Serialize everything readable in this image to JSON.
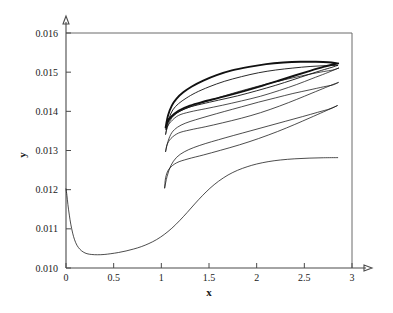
{
  "chart_data": {
    "type": "line",
    "title": "",
    "subtitle": "",
    "xlabel": "x",
    "ylabel": "y",
    "xlim": [
      0,
      3
    ],
    "ylim": [
      0.01,
      0.016
    ],
    "grid": false,
    "legend": null,
    "x_ticks": [
      "0",
      "0.5",
      "1",
      "1.5",
      "2",
      "2.5",
      "3"
    ],
    "x_tick_values": [
      0,
      0.5,
      1,
      1.5,
      2,
      2.5,
      3
    ],
    "y_ticks": [
      "0.010",
      "0.011",
      "0.012",
      "0.013",
      "0.014",
      "0.015",
      "0.016"
    ],
    "y_tick_values": [
      0.01,
      0.011,
      0.012,
      0.013,
      0.014,
      0.015,
      0.016
    ],
    "series": [
      {
        "name": "lower-branch",
        "style": "thin",
        "points": [
          [
            0.0,
            0.01202
          ],
          [
            0.01,
            0.01185
          ],
          [
            0.02,
            0.01162
          ],
          [
            0.035,
            0.01135
          ],
          [
            0.05,
            0.01112
          ],
          [
            0.07,
            0.01089
          ],
          [
            0.09,
            0.01072
          ],
          [
            0.115,
            0.01058
          ],
          [
            0.145,
            0.01048
          ],
          [
            0.18,
            0.01041
          ],
          [
            0.22,
            0.010365
          ],
          [
            0.27,
            0.010345
          ],
          [
            0.33,
            0.010338
          ],
          [
            0.4,
            0.010345
          ],
          [
            0.47,
            0.010365
          ],
          [
            0.55,
            0.010395
          ],
          [
            0.63,
            0.010435
          ],
          [
            0.71,
            0.010485
          ],
          [
            0.79,
            0.010545
          ],
          [
            0.87,
            0.010625
          ],
          [
            0.95,
            0.010725
          ],
          [
            1.03,
            0.010855
          ],
          [
            1.11,
            0.011015
          ],
          [
            1.19,
            0.011205
          ],
          [
            1.27,
            0.011415
          ],
          [
            1.35,
            0.011635
          ],
          [
            1.43,
            0.011845
          ],
          [
            1.51,
            0.012035
          ],
          [
            1.6,
            0.012215
          ],
          [
            1.7,
            0.012375
          ],
          [
            1.8,
            0.012495
          ],
          [
            1.9,
            0.012585
          ],
          [
            2.0,
            0.012655
          ],
          [
            2.12,
            0.012715
          ],
          [
            2.25,
            0.012758
          ],
          [
            2.4,
            0.012788
          ],
          [
            2.55,
            0.012805
          ],
          [
            2.7,
            0.012815
          ],
          [
            2.85,
            0.012818
          ]
        ]
      },
      {
        "name": "loop-1-outer-low",
        "style": "thin",
        "upper": [
          [
            1.035,
            0.012045
          ],
          [
            1.06,
            0.012335
          ],
          [
            1.1,
            0.012615
          ],
          [
            1.16,
            0.012825
          ],
          [
            1.24,
            0.012965
          ],
          [
            1.34,
            0.013075
          ],
          [
            1.46,
            0.013175
          ],
          [
            1.6,
            0.013275
          ],
          [
            1.76,
            0.013385
          ],
          [
            1.94,
            0.013505
          ],
          [
            2.12,
            0.013625
          ],
          [
            2.3,
            0.013745
          ],
          [
            2.48,
            0.013865
          ],
          [
            2.64,
            0.013975
          ],
          [
            2.77,
            0.014065
          ],
          [
            2.845,
            0.014145
          ]
        ],
        "lower": [
          [
            2.845,
            0.014145
          ],
          [
            2.8,
            0.014095
          ],
          [
            2.7,
            0.013985
          ],
          [
            2.56,
            0.013835
          ],
          [
            2.4,
            0.013665
          ],
          [
            2.22,
            0.013485
          ],
          [
            2.02,
            0.013305
          ],
          [
            1.82,
            0.013145
          ],
          [
            1.62,
            0.013005
          ],
          [
            1.44,
            0.012885
          ],
          [
            1.28,
            0.012785
          ],
          [
            1.16,
            0.012685
          ],
          [
            1.08,
            0.012525
          ],
          [
            1.045,
            0.012305
          ],
          [
            1.035,
            0.012045
          ]
        ]
      },
      {
        "name": "loop-2-mid",
        "style": "thin",
        "upper": [
          [
            1.045,
            0.012975
          ],
          [
            1.07,
            0.013235
          ],
          [
            1.11,
            0.013455
          ],
          [
            1.17,
            0.013595
          ],
          [
            1.25,
            0.013695
          ],
          [
            1.36,
            0.013785
          ],
          [
            1.5,
            0.013885
          ],
          [
            1.66,
            0.013995
          ],
          [
            1.84,
            0.014115
          ],
          [
            2.02,
            0.014235
          ],
          [
            2.2,
            0.014345
          ],
          [
            2.38,
            0.014455
          ],
          [
            2.55,
            0.014545
          ],
          [
            2.7,
            0.014625
          ],
          [
            2.8,
            0.014675
          ],
          [
            2.855,
            0.014735
          ]
        ],
        "lower": [
          [
            2.855,
            0.014735
          ],
          [
            2.81,
            0.014695
          ],
          [
            2.72,
            0.014605
          ],
          [
            2.58,
            0.014465
          ],
          [
            2.42,
            0.014305
          ],
          [
            2.24,
            0.014135
          ],
          [
            2.04,
            0.013965
          ],
          [
            1.84,
            0.013825
          ],
          [
            1.64,
            0.013705
          ],
          [
            1.46,
            0.013605
          ],
          [
            1.3,
            0.013525
          ],
          [
            1.18,
            0.013445
          ],
          [
            1.1,
            0.013305
          ],
          [
            1.06,
            0.013145
          ],
          [
            1.045,
            0.012975
          ]
        ]
      },
      {
        "name": "loop-3-upper",
        "style": "thin",
        "upper": [
          [
            1.045,
            0.013415
          ],
          [
            1.07,
            0.013645
          ],
          [
            1.11,
            0.013835
          ],
          [
            1.17,
            0.013965
          ],
          [
            1.25,
            0.014065
          ],
          [
            1.36,
            0.014165
          ],
          [
            1.5,
            0.014275
          ],
          [
            1.66,
            0.014395
          ],
          [
            1.84,
            0.014525
          ],
          [
            2.02,
            0.014645
          ],
          [
            2.2,
            0.014755
          ],
          [
            2.38,
            0.014855
          ],
          [
            2.55,
            0.014945
          ],
          [
            2.7,
            0.015015
          ],
          [
            2.8,
            0.015055
          ],
          [
            2.86,
            0.015105
          ]
        ],
        "lower": [
          [
            2.86,
            0.015105
          ],
          [
            2.81,
            0.015055
          ],
          [
            2.72,
            0.014965
          ],
          [
            2.58,
            0.014835
          ],
          [
            2.42,
            0.014685
          ],
          [
            2.24,
            0.014535
          ],
          [
            2.04,
            0.014385
          ],
          [
            1.84,
            0.014265
          ],
          [
            1.64,
            0.014155
          ],
          [
            1.46,
            0.014065
          ],
          [
            1.3,
            0.013985
          ],
          [
            1.18,
            0.013895
          ],
          [
            1.1,
            0.013735
          ],
          [
            1.06,
            0.013585
          ],
          [
            1.045,
            0.013415
          ]
        ]
      },
      {
        "name": "loop-4-top-bold",
        "style": "bold",
        "upper": [
          [
            1.045,
            0.013585
          ],
          [
            1.07,
            0.013895
          ],
          [
            1.11,
            0.014145
          ],
          [
            1.16,
            0.014325
          ],
          [
            1.23,
            0.014485
          ],
          [
            1.32,
            0.014635
          ],
          [
            1.44,
            0.014785
          ],
          [
            1.58,
            0.014925
          ],
          [
            1.74,
            0.015045
          ],
          [
            1.92,
            0.015135
          ],
          [
            2.1,
            0.015205
          ],
          [
            2.28,
            0.015245
          ],
          [
            2.46,
            0.015265
          ],
          [
            2.62,
            0.015265
          ],
          [
            2.75,
            0.015255
          ],
          [
            2.855,
            0.015225
          ]
        ],
        "lower": [
          [
            2.855,
            0.015225
          ],
          [
            2.8,
            0.015195
          ],
          [
            2.7,
            0.015135
          ],
          [
            2.56,
            0.015035
          ],
          [
            2.4,
            0.014915
          ],
          [
            2.22,
            0.014775
          ],
          [
            2.02,
            0.014625
          ],
          [
            1.82,
            0.014485
          ],
          [
            1.62,
            0.014355
          ],
          [
            1.44,
            0.014245
          ],
          [
            1.3,
            0.014145
          ],
          [
            1.18,
            0.014015
          ],
          [
            1.1,
            0.013855
          ],
          [
            1.06,
            0.013715
          ],
          [
            1.045,
            0.013585
          ]
        ]
      },
      {
        "name": "loop-5-top-thin-inner",
        "style": "med",
        "upper": [
          [
            1.05,
            0.013535
          ],
          [
            1.08,
            0.013815
          ],
          [
            1.12,
            0.014035
          ],
          [
            1.18,
            0.014195
          ],
          [
            1.26,
            0.014335
          ],
          [
            1.36,
            0.014475
          ],
          [
            1.5,
            0.014625
          ],
          [
            1.66,
            0.014765
          ],
          [
            1.84,
            0.014885
          ],
          [
            2.02,
            0.014985
          ],
          [
            2.2,
            0.015055
          ],
          [
            2.38,
            0.015105
          ],
          [
            2.56,
            0.015145
          ],
          [
            2.72,
            0.015165
          ],
          [
            2.85,
            0.015175
          ]
        ],
        "lower": [
          [
            2.85,
            0.015175
          ],
          [
            2.79,
            0.015125
          ],
          [
            2.68,
            0.015045
          ],
          [
            2.54,
            0.014935
          ],
          [
            2.38,
            0.014805
          ],
          [
            2.2,
            0.014665
          ],
          [
            2.0,
            0.014525
          ],
          [
            1.8,
            0.014395
          ],
          [
            1.6,
            0.014285
          ],
          [
            1.42,
            0.014185
          ],
          [
            1.28,
            0.014095
          ],
          [
            1.16,
            0.013955
          ],
          [
            1.09,
            0.013795
          ],
          [
            1.06,
            0.013655
          ],
          [
            1.05,
            0.013535
          ]
        ]
      }
    ]
  },
  "axes": {
    "x_axis_title": "x",
    "y_axis_title": "y"
  }
}
